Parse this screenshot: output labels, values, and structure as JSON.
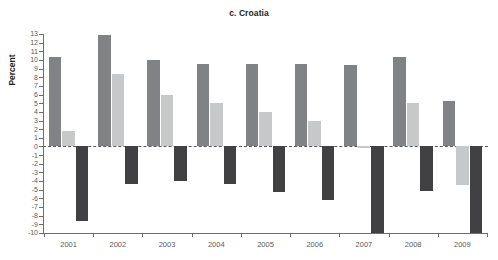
{
  "chart_data": {
    "type": "bar",
    "title": "c. Croatia",
    "xlabel": "",
    "ylabel": "Percent",
    "categories": [
      "2001",
      "2002",
      "2003",
      "2004",
      "2005",
      "2006",
      "2007",
      "2008",
      "2009"
    ],
    "ylim": [
      -10,
      13
    ],
    "yticks": [
      13,
      12,
      11,
      10,
      9,
      8,
      7,
      6,
      5,
      4,
      3,
      2,
      1,
      0,
      -1,
      -2,
      -3,
      -4,
      -5,
      -6,
      -7,
      -8,
      -9,
      -10
    ],
    "ytick_labels": [
      "13",
      "12",
      "11",
      "10",
      "9",
      "8",
      "7",
      "6",
      "5",
      "4",
      "3",
      "2",
      "1",
      "0",
      "-1",
      "-2",
      "-3",
      "-4",
      "-5",
      "-6",
      "-7",
      "-8",
      "-9",
      "-10"
    ],
    "grid": false,
    "legend": "none",
    "zero_reference_line": true,
    "series": [
      {
        "name": "series-1",
        "color": "#808285",
        "values": [
          10.3,
          12.9,
          10.0,
          9.5,
          9.5,
          9.5,
          9.4,
          10.3,
          5.2
        ]
      },
      {
        "name": "series-2",
        "color": "#c7c8ca",
        "values": [
          1.8,
          8.4,
          6.0,
          5.0,
          4.0,
          3.0,
          -0.2,
          5.0,
          -4.5
        ]
      },
      {
        "name": "series-3",
        "color": "#414042",
        "values": [
          -8.6,
          -4.3,
          -4.0,
          -4.3,
          -5.3,
          -6.2,
          -10.0,
          -5.2,
          -10.0
        ]
      }
    ]
  }
}
